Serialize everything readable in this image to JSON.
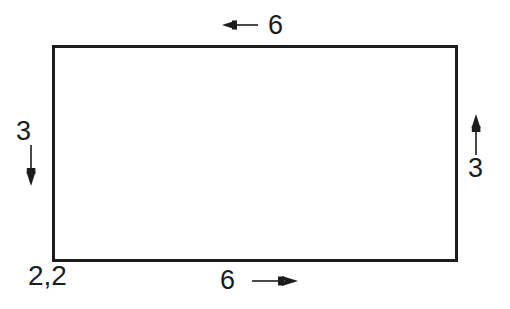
{
  "diagram": {
    "type": "dimensioned-rectangle",
    "background_color": "#ffffff",
    "stroke_color": "#1c1c1c",
    "shape": {
      "name": "rectangle",
      "x": 52,
      "y": 45,
      "width": 406,
      "height": 217,
      "stroke_width": 3,
      "fill": "none"
    },
    "origin_label": {
      "text": "2,2",
      "position": "bottom-left"
    },
    "dimensions": [
      {
        "id": "top",
        "label": "6",
        "value": 6,
        "arrow_direction": "left",
        "position": "above-top-edge"
      },
      {
        "id": "left",
        "label": "3",
        "value": 3,
        "arrow_direction": "down",
        "position": "left-of-left-edge"
      },
      {
        "id": "right",
        "label": "3",
        "value": 3,
        "arrow_direction": "up",
        "position": "right-of-right-edge"
      },
      {
        "id": "bottom",
        "label": "6",
        "value": 6,
        "arrow_direction": "right",
        "position": "below-bottom-edge"
      }
    ]
  }
}
